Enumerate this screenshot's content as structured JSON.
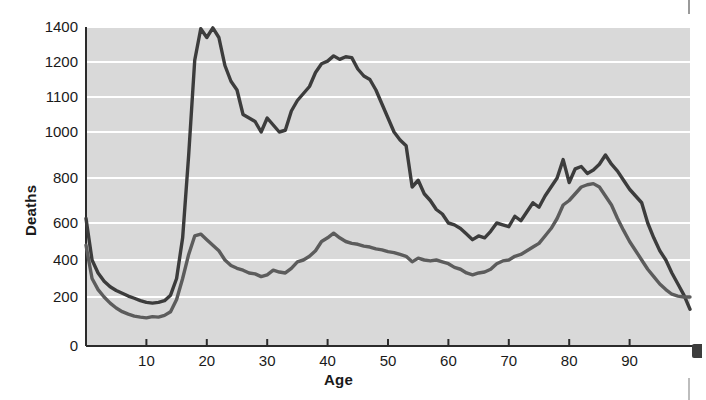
{
  "chart_data": {
    "type": "line",
    "title": "",
    "xlabel": "Age",
    "ylabel": "Deaths",
    "xlim": [
      0,
      100
    ],
    "ylim": [
      0,
      1400
    ],
    "grid": true,
    "legend_position": "inline-annotation",
    "x_ticks": [
      10,
      20,
      30,
      40,
      50,
      60,
      70,
      80,
      90
    ],
    "y_ticks": [
      0,
      200,
      400,
      600,
      800,
      1000,
      1100,
      1200,
      1400
    ],
    "background_color": "#d9d9d9",
    "gridline_color": "#ffffff",
    "series": [
      {
        "name": "Males",
        "color": "#3c3c3c",
        "x": [
          0,
          1,
          2,
          3,
          4,
          5,
          6,
          7,
          8,
          9,
          10,
          11,
          12,
          13,
          14,
          15,
          16,
          17,
          18,
          19,
          20,
          21,
          22,
          23,
          24,
          25,
          26,
          27,
          28,
          29,
          30,
          31,
          32,
          33,
          34,
          35,
          36,
          37,
          38,
          39,
          40,
          41,
          42,
          43,
          44,
          45,
          46,
          47,
          48,
          49,
          50,
          51,
          52,
          53,
          54,
          55,
          56,
          57,
          58,
          59,
          60,
          61,
          62,
          63,
          64,
          65,
          66,
          67,
          68,
          69,
          70,
          71,
          72,
          73,
          74,
          75,
          76,
          77,
          78,
          79,
          80,
          81,
          82,
          83,
          84,
          85,
          86,
          87,
          88,
          89,
          90,
          91,
          92,
          93,
          94,
          95,
          96,
          97,
          98,
          99,
          100
        ],
        "values": [
          620,
          400,
          330,
          285,
          255,
          235,
          220,
          205,
          195,
          185,
          178,
          175,
          178,
          185,
          210,
          300,
          520,
          900,
          1210,
          1390,
          1340,
          1395,
          1340,
          1190,
          1145,
          1120,
          1050,
          1040,
          1030,
          1000,
          1040,
          1020,
          1000,
          1005,
          1060,
          1090,
          1110,
          1130,
          1170,
          1195,
          1205,
          1235,
          1215,
          1230,
          1225,
          1180,
          1160,
          1150,
          1120,
          1080,
          1040,
          1000,
          965,
          940,
          760,
          790,
          730,
          700,
          660,
          640,
          600,
          590,
          570,
          540,
          510,
          530,
          520,
          555,
          600,
          590,
          580,
          630,
          610,
          650,
          690,
          670,
          720,
          760,
          800,
          880,
          780,
          840,
          850,
          820,
          835,
          860,
          900,
          860,
          830,
          790,
          750,
          720,
          690,
          600,
          520,
          450,
          400,
          330,
          270,
          210,
          150
        ]
      },
      {
        "name": "Females",
        "color": "#5c5c5c",
        "x": [
          0,
          1,
          2,
          3,
          4,
          5,
          6,
          7,
          8,
          9,
          10,
          11,
          12,
          13,
          14,
          15,
          16,
          17,
          18,
          19,
          20,
          21,
          22,
          23,
          24,
          25,
          26,
          27,
          28,
          29,
          30,
          31,
          32,
          33,
          34,
          35,
          36,
          37,
          38,
          39,
          40,
          41,
          42,
          43,
          44,
          45,
          46,
          47,
          48,
          49,
          50,
          51,
          52,
          53,
          54,
          55,
          56,
          57,
          58,
          59,
          60,
          61,
          62,
          63,
          64,
          65,
          66,
          67,
          68,
          69,
          70,
          71,
          72,
          73,
          74,
          75,
          76,
          77,
          78,
          79,
          80,
          81,
          82,
          83,
          84,
          85,
          86,
          87,
          88,
          89,
          90,
          91,
          92,
          93,
          94,
          95,
          96,
          97,
          98,
          99,
          100
        ],
        "values": [
          480,
          300,
          240,
          200,
          175,
          155,
          140,
          130,
          122,
          118,
          115,
          120,
          118,
          125,
          140,
          190,
          300,
          430,
          530,
          540,
          510,
          480,
          450,
          400,
          370,
          355,
          345,
          330,
          325,
          310,
          320,
          345,
          335,
          330,
          355,
          390,
          400,
          420,
          450,
          500,
          520,
          545,
          520,
          500,
          490,
          485,
          475,
          470,
          460,
          455,
          445,
          440,
          430,
          420,
          390,
          410,
          400,
          395,
          400,
          390,
          380,
          360,
          350,
          330,
          320,
          330,
          335,
          350,
          380,
          395,
          400,
          420,
          430,
          450,
          470,
          490,
          530,
          570,
          620,
          680,
          700,
          730,
          760,
          770,
          775,
          760,
          720,
          680,
          620,
          560,
          500,
          450,
          400,
          350,
          310,
          270,
          240,
          215,
          205,
          200,
          200
        ]
      }
    ],
    "annotations": [
      {
        "text": "Males",
        "x": 59,
        "y": 1115
      },
      {
        "text": "Females",
        "x": 37,
        "y": 640
      }
    ]
  },
  "axes": {
    "y_title": "Deaths",
    "x_title": "Age"
  }
}
